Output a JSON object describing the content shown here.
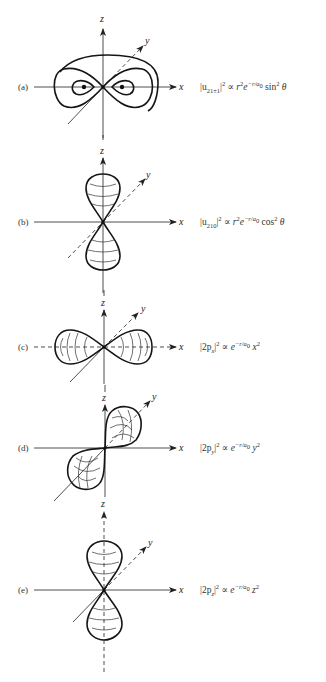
{
  "figure": {
    "panels": [
      {
        "id": "a",
        "label": "(a)",
        "axes": {
          "x": "x",
          "y": "y",
          "z": "z"
        },
        "equation": {
          "lhs": "|u",
          "sub": "21±1",
          "pow": "2",
          "rel": "∝",
          "r": "r",
          "r_pow": "2",
          "exp_base": "e",
          "exp": "−r/a",
          "exp_sub": "0",
          "func": "sin",
          "func_pow": "2",
          "arg": "θ"
        },
        "shape": "torus (sin² θ) – donut around z axis"
      },
      {
        "id": "b",
        "label": "(b)",
        "axes": {
          "x": "x",
          "y": "y",
          "z": "z"
        },
        "equation": {
          "lhs": "|u",
          "sub": "210",
          "pow": "2",
          "rel": "∝",
          "r": "r",
          "r_pow": "2",
          "exp_base": "e",
          "exp": "−r/a",
          "exp_sub": "0",
          "func": "cos",
          "func_pow": "2",
          "arg": "θ"
        },
        "shape": "dumbbell along z"
      },
      {
        "id": "c",
        "label": "(c)",
        "axes": {
          "x": "x",
          "y": "y",
          "z": "z"
        },
        "equation": {
          "lhs": "|2p",
          "sub": "x",
          "pow": "2",
          "rel": "∝",
          "exp_base": "e",
          "exp": "−r/a",
          "exp_sub": "0",
          "var": "x",
          "var_pow": "2"
        },
        "shape": "dumbbell along x"
      },
      {
        "id": "d",
        "label": "(d)",
        "axes": {
          "x": "x",
          "y": "y",
          "z": "z"
        },
        "equation": {
          "lhs": "|2p",
          "sub": "y",
          "pow": "2",
          "rel": "∝",
          "exp_base": "e",
          "exp": "−r/a",
          "exp_sub": "0",
          "var": "y",
          "var_pow": "2"
        },
        "shape": "dumbbell along y"
      },
      {
        "id": "e",
        "label": "(e)",
        "axes": {
          "x": "x",
          "y": "y",
          "z": "z"
        },
        "equation": {
          "lhs": "|2p",
          "sub": "z",
          "pow": "2",
          "rel": "∝",
          "exp_base": "e",
          "exp": "−r/a",
          "exp_sub": "0",
          "var": "z",
          "var_pow": "2"
        },
        "shape": "dumbbell along z"
      }
    ]
  }
}
